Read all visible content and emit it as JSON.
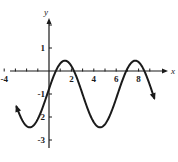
{
  "chart_data": {
    "type": "line",
    "title": "",
    "xlabel": "x",
    "ylabel": "y",
    "xlim": [
      -4.5,
      10
    ],
    "ylim": [
      -3.2,
      2.8
    ],
    "grid": false,
    "x_ticks": [
      -4,
      -3,
      -2,
      -1,
      1,
      2,
      3,
      4,
      5,
      6,
      7,
      8,
      9
    ],
    "x_tick_labels": [
      {
        "value": -4,
        "label": "-4"
      },
      {
        "value": 2,
        "label": "2"
      },
      {
        "value": 4,
        "label": "4"
      },
      {
        "value": 6,
        "label": "6"
      },
      {
        "value": 8,
        "label": "8"
      }
    ],
    "y_ticks": [
      2,
      1,
      -1,
      -2,
      -3
    ],
    "y_tick_labels": [
      {
        "value": 1,
        "label": "1"
      },
      {
        "value": -1,
        "label": "-1"
      },
      {
        "value": -2,
        "label": "2"
      },
      {
        "value": -3,
        "label": "-3"
      }
    ],
    "series": [
      {
        "name": "y = -1 + 1.45 sin(x + 0.15)",
        "function": {
          "offset": -1,
          "amplitude": 1.45,
          "frequency": 1,
          "phase": 0.15
        },
        "x_range": [
          -2.9,
          9.4
        ],
        "arrows": [
          "start",
          "end"
        ],
        "color": "#1a1a1a",
        "key_points": [
          {
            "x": -1.72,
            "y": -2.45,
            "type": "min"
          },
          {
            "x": 1.42,
            "y": 0.45,
            "type": "max"
          },
          {
            "x": 4.56,
            "y": -2.45,
            "type": "min"
          },
          {
            "x": 7.7,
            "y": 0.45,
            "type": "max"
          },
          {
            "x": 0,
            "y": -0.78,
            "type": "y-intercept"
          }
        ]
      }
    ]
  },
  "layout": {
    "origin_px": [
      49,
      71
    ],
    "unit_x_px": 11.2,
    "unit_y_px": 23,
    "y_axis_top_px": 18,
    "y_axis_bottom_px": 148,
    "x_axis_left_px": 10,
    "x_axis_right_px": 168
  }
}
